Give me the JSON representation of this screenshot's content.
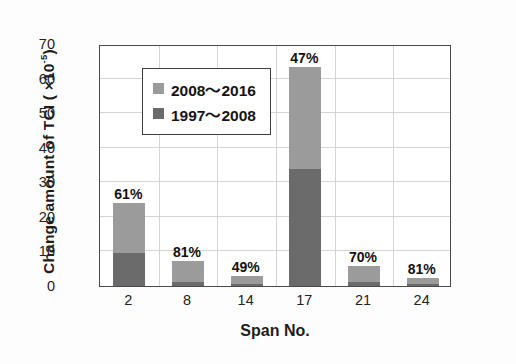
{
  "chart_data": {
    "type": "bar",
    "title": "",
    "subtitle": "",
    "xlabel": "Span No.",
    "ylabel": "Change amount of TCI ( ×10",
    "ylabel_exponent": "-5",
    "ylabel_suffix": ")",
    "categories": [
      "2",
      "8",
      "14",
      "17",
      "21",
      "24"
    ],
    "ylim": [
      0,
      70
    ],
    "yticks": [
      0,
      10,
      20,
      30,
      40,
      50,
      60,
      70
    ],
    "ytick_labels": [
      "0",
      "10",
      "20",
      "30",
      "40",
      "50",
      "60",
      "70"
    ],
    "grid": true,
    "grid_axis": "both",
    "stacked": true,
    "legend_position": "upper-left-inside",
    "series": [
      {
        "name": "1997～2008",
        "color": "#6b6b6b",
        "values": [
          9.5,
          1.3,
          0.6,
          33.8,
          1.2,
          0.5
        ]
      },
      {
        "name": "2008～2016",
        "color": "#9b9b9b",
        "values": [
          14.5,
          5.8,
          2.3,
          29.5,
          4.6,
          1.7
        ]
      }
    ],
    "totals": [
      24.0,
      7.1,
      2.9,
      63.3,
      5.8,
      2.2
    ],
    "annotations": [
      "61%",
      "81%",
      "49%",
      "47%",
      "70%",
      "81%"
    ]
  },
  "legend": {
    "items": [
      {
        "label": "2008～2016",
        "swatch": "light-gray-square"
      },
      {
        "label": "1997～2008",
        "swatch": "dark-gray-square"
      }
    ]
  },
  "colors": {
    "series_recent": "#9b9b9b",
    "series_older": "#6b6b6b",
    "frame": "#4a4a4a",
    "grid": "#d4d4d4",
    "text": "#1d1d1d"
  }
}
